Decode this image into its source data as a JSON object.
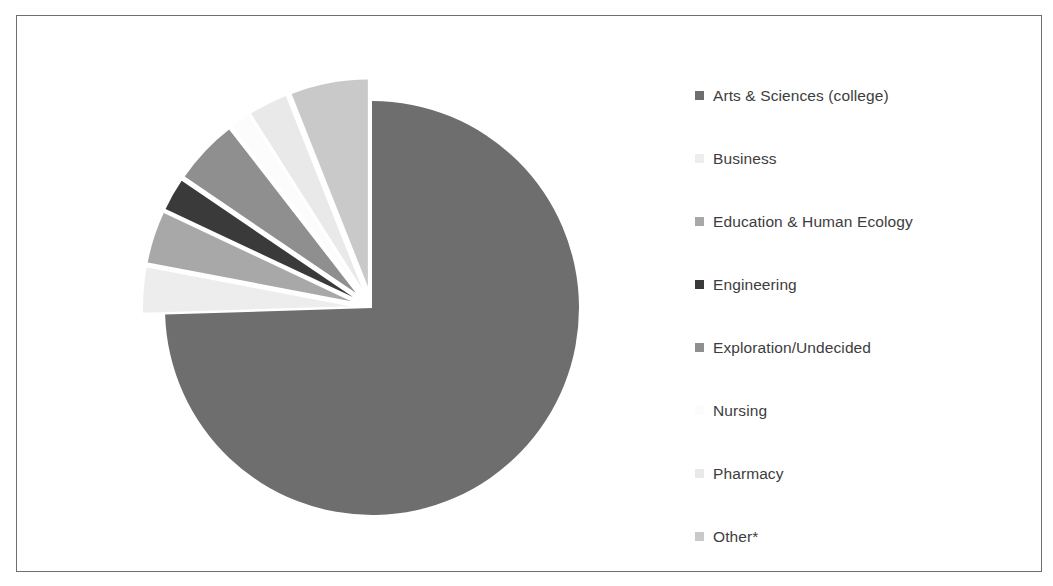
{
  "figure": {
    "border_color": "#6e6e6e",
    "background": "#ffffff"
  },
  "chart_data": {
    "type": "pie",
    "title": "",
    "subtitle": "",
    "xlabel": "",
    "ylabel": "",
    "legend_position": "right",
    "grid": false,
    "explode_note": "All slices except the largest are exploded outward from the center",
    "categories": [
      "Arts & Sciences (college)",
      "Business",
      "Education & Human Ecology",
      "Engineering",
      "Exploration/Undecided",
      "Nursing",
      "Pharmacy",
      "Other*"
    ],
    "values": [
      74.5,
      3.5,
      4.0,
      2.5,
      5.0,
      1.5,
      3.0,
      6.0
    ],
    "colors": [
      "#6e6e6e",
      "#ededed",
      "#a8a8a8",
      "#3a3a3a",
      "#8f8f8f",
      "#fcfcfc",
      "#e9e9e9",
      "#c9c9c9"
    ],
    "slices": [
      {
        "label": "Arts & Sciences (college)",
        "value": 74.5,
        "color": "#6e6e6e",
        "exploded": false
      },
      {
        "label": "Business",
        "value": 3.5,
        "color": "#ededed",
        "exploded": true
      },
      {
        "label": "Education & Human Ecology",
        "value": 4.0,
        "color": "#a8a8a8",
        "exploded": true
      },
      {
        "label": "Engineering",
        "value": 2.5,
        "color": "#3a3a3a",
        "exploded": true
      },
      {
        "label": "Exploration/Undecided",
        "value": 5.0,
        "color": "#8f8f8f",
        "exploded": true
      },
      {
        "label": "Nursing",
        "value": 1.5,
        "color": "#fcfcfc",
        "exploded": true
      },
      {
        "label": "Pharmacy",
        "value": 3.0,
        "color": "#e9e9e9",
        "exploded": true
      },
      {
        "label": "Other*",
        "value": 6.0,
        "color": "#c9c9c9",
        "exploded": true
      }
    ]
  },
  "legend": {
    "items": [
      {
        "label": "Arts & Sciences (college)",
        "color": "#6e6e6e"
      },
      {
        "label": "Business",
        "color": "#ededed"
      },
      {
        "label": "Education & Human Ecology",
        "color": "#a8a8a8"
      },
      {
        "label": "Engineering",
        "color": "#3a3a3a"
      },
      {
        "label": "Exploration/Undecided",
        "color": "#8f8f8f"
      },
      {
        "label": "Nursing",
        "color": "#fcfcfc"
      },
      {
        "label": "Pharmacy",
        "color": "#e9e9e9"
      },
      {
        "label": "Other*",
        "color": "#c9c9c9"
      }
    ]
  }
}
